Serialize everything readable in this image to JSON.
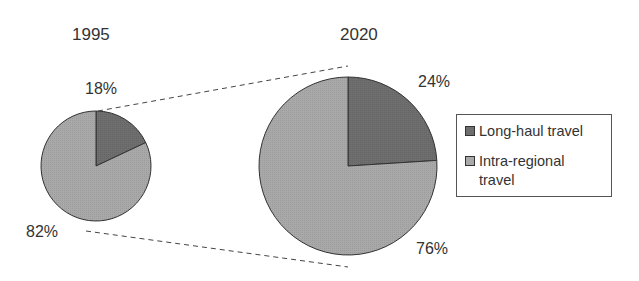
{
  "chart_data": [
    {
      "type": "pie",
      "title": "1995",
      "categories": [
        "Long-haul travel",
        "Intra-regional travel"
      ],
      "values": [
        18,
        82
      ],
      "labels": [
        "18%",
        "82%"
      ],
      "colors": [
        "#6e6e6e",
        "#a9a9a9"
      ]
    },
    {
      "type": "pie",
      "title": "2020",
      "categories": [
        "Long-haul travel",
        "Intra-regional travel"
      ],
      "values": [
        24,
        76
      ],
      "labels": [
        "24%",
        "76%"
      ],
      "colors": [
        "#6e6e6e",
        "#a9a9a9"
      ]
    }
  ],
  "pies": {
    "p1995": {
      "title": "1995",
      "long_label": "18%",
      "intra_label": "82%"
    },
    "p2020": {
      "title": "2020",
      "long_label": "24%",
      "intra_label": "76%"
    }
  },
  "legend": {
    "items": [
      {
        "label": "Long-haul travel",
        "color": "#6e6e6e"
      },
      {
        "label": "Intra-regional travel",
        "color": "#a9a9a9"
      }
    ]
  }
}
